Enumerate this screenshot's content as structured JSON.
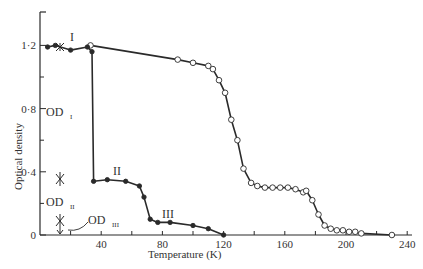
{
  "chart_data": {
    "type": "line",
    "title": "",
    "xlabel": "Temperature (K)",
    "ylabel": "Optical density",
    "xlim": [
      0,
      245
    ],
    "ylim": [
      0,
      1.35
    ],
    "xticks": [
      40,
      80,
      120,
      160,
      200,
      240
    ],
    "xticks_minor": [
      20,
      40,
      60,
      80,
      100,
      120,
      140,
      160,
      180,
      200,
      220,
      240
    ],
    "yticks": [
      0,
      0.4,
      0.8,
      1.2
    ],
    "ytick_labels": [
      "0",
      "0·4",
      "0·8",
      "1·2"
    ],
    "grid": false,
    "legend": null,
    "series": [
      {
        "name": "I (warming, open circles)",
        "marker": "open-circle",
        "points": [
          [
            33,
            1.2
          ],
          [
            90,
            1.11
          ],
          [
            100,
            1.09
          ],
          [
            110,
            1.07
          ],
          [
            113,
            1.05
          ],
          [
            117,
            0.98
          ],
          [
            121,
            0.9
          ],
          [
            125,
            0.73
          ],
          [
            129,
            0.6
          ],
          [
            133,
            0.42
          ],
          [
            138,
            0.33
          ],
          [
            142,
            0.31
          ],
          [
            147,
            0.3
          ],
          [
            152,
            0.3
          ],
          [
            157,
            0.3
          ],
          [
            162,
            0.3
          ],
          [
            167,
            0.29
          ],
          [
            172,
            0.27
          ],
          [
            174,
            0.28
          ],
          [
            178,
            0.22
          ],
          [
            182,
            0.13
          ],
          [
            186,
            0.06
          ],
          [
            190,
            0.04
          ],
          [
            194,
            0.03
          ],
          [
            198,
            0.03
          ],
          [
            202,
            0.02
          ],
          [
            206,
            0.02
          ],
          [
            210,
            0.01
          ],
          [
            230,
            0.0
          ]
        ]
      },
      {
        "name": "I/II/III (cooling, filled circles)",
        "marker": "filled-circle",
        "points": [
          [
            5,
            1.19
          ],
          [
            10,
            1.2
          ],
          [
            20,
            1.17
          ],
          [
            31,
            1.19
          ],
          [
            34,
            1.16
          ],
          [
            35,
            0.34
          ],
          [
            44,
            0.35
          ],
          [
            56,
            0.34
          ],
          [
            65,
            0.31
          ],
          [
            68,
            0.24
          ],
          [
            72,
            0.1
          ],
          [
            77,
            0.08
          ],
          [
            85,
            0.08
          ],
          [
            100,
            0.06
          ],
          [
            110,
            0.04
          ],
          [
            120,
            0.0
          ]
        ]
      }
    ],
    "annotations": [
      {
        "text": "I",
        "x": 27,
        "y": 1.22
      },
      {
        "text": "II",
        "x": 52,
        "y": 0.38
      },
      {
        "text": "III",
        "x": 80,
        "y": 0.1
      },
      {
        "text": "OD",
        "sub": "I",
        "x": 5,
        "y": 0.78
      },
      {
        "text": "OD",
        "sub": "II",
        "x": 5,
        "y": 0.17
      },
      {
        "text": "OD",
        "sub": "III",
        "x": 30,
        "y": 0.1
      }
    ]
  },
  "labels": {
    "x_title": "Temperature (K)",
    "y_title": "Optical density",
    "curve_I": "I",
    "curve_II": "II",
    "curve_III": "III",
    "od": "OD",
    "od_I_sub": "I",
    "od_II_sub": "II",
    "od_III_sub": "III"
  },
  "colors": {
    "line": "#2a2a2a",
    "marker_fill": "#2a2a2a",
    "open_marker_fill": "#ffffff",
    "text": "#333333"
  }
}
